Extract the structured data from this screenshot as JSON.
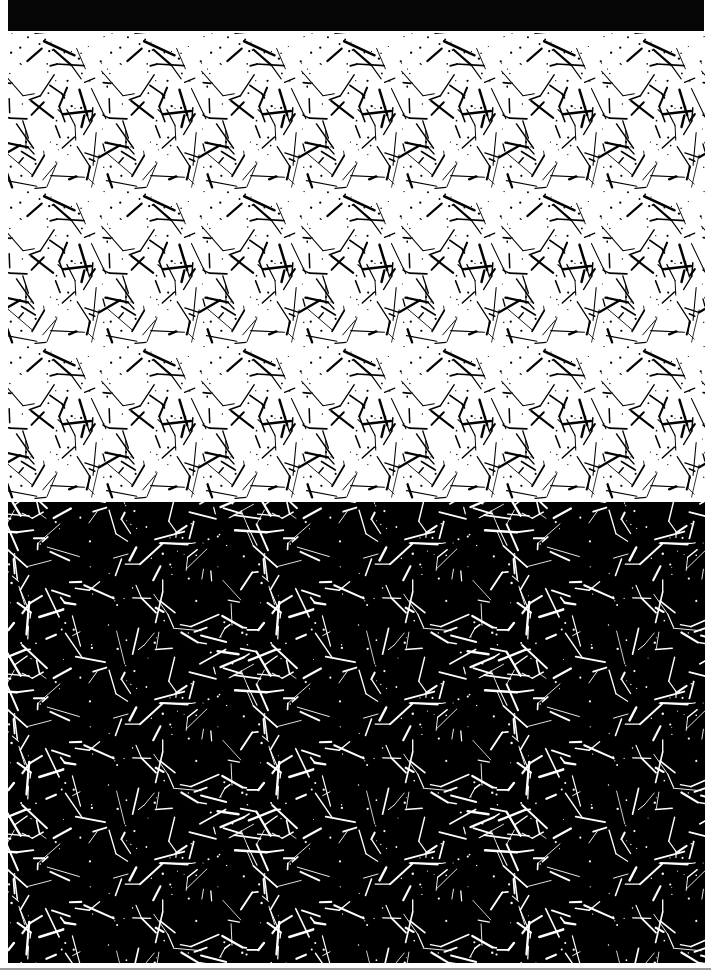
{
  "header": {
    "title": ""
  },
  "panels": {
    "top": {
      "label": "stereogram-light",
      "background": "#ffffff",
      "stroke": "#000000",
      "tile_width": 100,
      "tile_height": 155,
      "seed": 7,
      "line_count": 46,
      "dot_count": 60
    },
    "bottom": {
      "label": "stereogram-dark",
      "background": "#000000",
      "stroke": "#ffffff",
      "tile_width": 250,
      "tile_height": 160,
      "seed": 23,
      "line_count": 90,
      "dot_count": 70
    }
  },
  "footer": {
    "rule_color": "#9a9a9a"
  }
}
